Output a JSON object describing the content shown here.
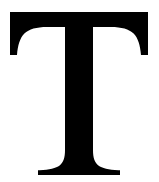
{
  "image": {
    "kind": "letterform-glyph",
    "character": "T",
    "script": "Latin",
    "case": "uppercase",
    "typeface_style": "serif",
    "width": 159,
    "height": 182,
    "background_color": "#ffffff",
    "glyph_color": "#000000"
  },
  "glyph": {
    "name": "letter-t",
    "label": "T",
    "description": "Uppercase serif letter T",
    "metrics": {
      "cap_top_y": 12,
      "baseline_y": 175,
      "bar_left_x": 10,
      "bar_right_x": 148,
      "bar_thickness": 14,
      "serif_drop_y": 55,
      "stem_left_x": 67,
      "stem_right_x": 93,
      "stem_width": 26,
      "stem_center_x": 79.5,
      "foot_left_x": 38,
      "foot_right_x": 120
    },
    "outline_path": "M 10 12 L 148 12 L 148 55 L 141 55 C 140.2 45.5 138.0 38.0 133.6 33.6 C 129.0 29.0 121.5 27.0 111.0 27.0 L 93 27.0 L 93 150 C 93 157.5 94.6 162.5 98.4 165.4 C 102.0 168.1 108.6 169.6 118.4 170.2 L 120 170.3 L 120 175 L 38 175 L 38 170.3 L 39.6 170.2 C 49.4 169.6 56.0 168.1 59.6 165.4 C 63.4 162.5 65 157.5 65 150 L 65 27.0 L 47.0 27.0 C 36.5 27.0 29.0 29.0 24.4 33.6 C 20.0 38.0 17.8 45.5 17.0 55 L 10 55 Z"
  }
}
